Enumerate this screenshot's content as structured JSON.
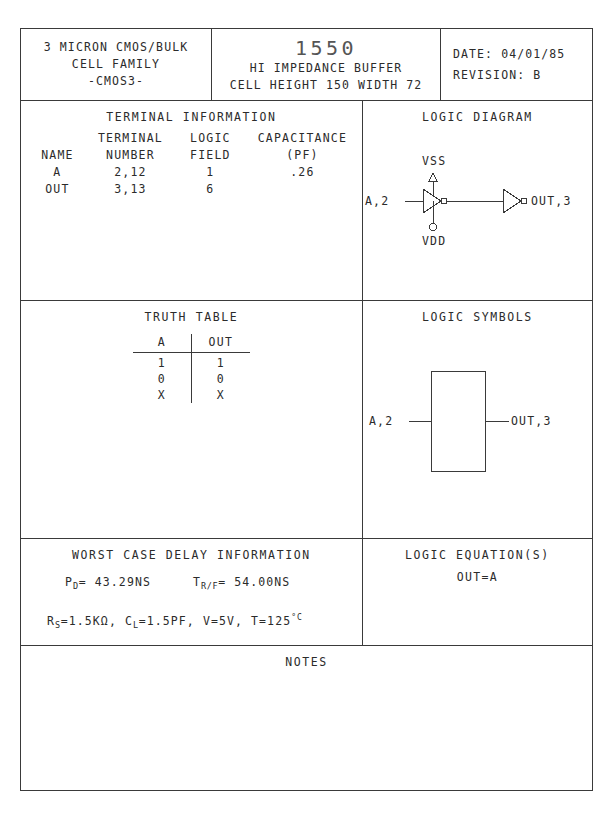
{
  "header": {
    "family_lines": [
      "3 MICRON CMOS/BULK",
      "CELL FAMILY",
      "-CMOS3-"
    ],
    "part_number": "1550",
    "part_desc": "HI IMPEDANCE BUFFER",
    "part_geometry": "CELL HEIGHT 150  WIDTH 72",
    "date_label": "DATE: 04/01/85",
    "revision_label": "REVISION: B"
  },
  "terminal": {
    "title": "TERMINAL INFORMATION",
    "header_row1": [
      "",
      "TERMINAL",
      "LOGIC",
      "CAPACITANCE"
    ],
    "header_row2": [
      "NAME",
      "NUMBER",
      "FIELD",
      "(PF)"
    ],
    "rows": [
      {
        "name": "A",
        "number": "2,12",
        "logic_field": "1",
        "capacitance": ".26"
      },
      {
        "name": "OUT",
        "number": "3,13",
        "logic_field": "6",
        "capacitance": ""
      }
    ]
  },
  "logic_diagram": {
    "title": "LOGIC DIAGRAM",
    "input_label": "A,2",
    "output_label": "OUT,3",
    "supply_top": "VSS",
    "supply_bottom": "VDD"
  },
  "truth_table": {
    "title": "TRUTH TABLE",
    "columns": [
      "A",
      "OUT"
    ],
    "rows": [
      [
        "1",
        "1"
      ],
      [
        "0",
        "0"
      ],
      [
        "X",
        "X"
      ]
    ]
  },
  "logic_symbols": {
    "title": "LOGIC SYMBOLS",
    "input_label": "A,2",
    "output_label": "OUT,3"
  },
  "delay": {
    "title": "WORST CASE DELAY INFORMATION",
    "pd_symbol": "P",
    "pd_sub": "D",
    "pd_value": "= 43.29NS",
    "trf_symbol": "T",
    "trf_sub": "R/F",
    "trf_value": "= 54.00NS",
    "rs_symbol": "R",
    "rs_sub": "S",
    "rs_value": "=1.5KΩ,",
    "cl_symbol": "C",
    "cl_sub": "L",
    "cl_value": "=1.5PF,",
    "voltage": "V=5V,",
    "temperature": "T=125",
    "temperature_unit": "°C"
  },
  "equation": {
    "title": "LOGIC EQUATION(S)",
    "text": "OUT=A"
  },
  "notes": {
    "title": "NOTES",
    "body": ""
  },
  "colors": {
    "ink": "#2b2b2b",
    "rule": "#3a3a3a",
    "paper": "#ffffff",
    "part_number": "#555555"
  }
}
